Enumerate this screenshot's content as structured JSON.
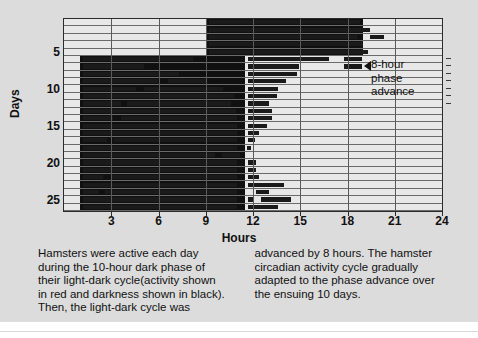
{
  "figure": {
    "background_color": "#dcdcdc",
    "plot_background_color": "#e8e8e8",
    "bar_color": "#101010"
  },
  "axes": {
    "x_title": "Hours",
    "y_title": "Days",
    "x_ticks": [
      "3",
      "6",
      "9",
      "12",
      "15",
      "18",
      "21",
      "24"
    ],
    "x_tick_values": [
      3,
      6,
      9,
      12,
      15,
      18,
      21,
      24
    ],
    "x_range": [
      0,
      24
    ],
    "y_ticks": [
      "5",
      "10",
      "15",
      "20",
      "25"
    ],
    "y_tick_values": [
      5,
      10,
      15,
      20,
      25
    ],
    "y_range": [
      0.5,
      26.5
    ]
  },
  "annotation": {
    "arrow": "left-triangle-arrow",
    "lines": [
      "8-hour",
      "phase",
      "advance"
    ],
    "day": 6
  },
  "caption": {
    "left_lines": [
      "Hamsters were active each day",
      "during the 10-hour dark phase of",
      "their light-dark cycle(activity shown",
      "in red and darkness shown in black).",
      "Then, the light-dark cycle was"
    ],
    "right_lines": [
      "advanced by 8 hours. The hamster",
      "circadian activity cycle gradually",
      "adapted to the phase advance over",
      "the ensuing 10 days."
    ]
  },
  "chart_data": {
    "type": "bar",
    "title": "",
    "subtitle": "",
    "xlabel": "Hours",
    "ylabel": "Days",
    "xlim": [
      0,
      24
    ],
    "ylim": [
      26.5,
      0.5
    ],
    "grid": true,
    "legend": "none",
    "dark_phase_before_shift": {
      "days": [
        1,
        5
      ],
      "start_hour": 9.0,
      "end_hour": 19.0
    },
    "dark_phase_after_shift": {
      "days": [
        6,
        26
      ],
      "start_hour": 1.0,
      "end_hour": 11.5
    },
    "rows": [
      {
        "day": 1,
        "dark": [
          9.0,
          19.0
        ],
        "activity": [
          [
            9.2,
            18.8
          ]
        ]
      },
      {
        "day": 2,
        "dark": [
          9.0,
          19.0
        ],
        "activity": [
          [
            9.2,
            19.4
          ]
        ]
      },
      {
        "day": 3,
        "dark": [
          9.0,
          19.0
        ],
        "activity": [
          [
            9.2,
            18.6
          ],
          [
            19.4,
            20.3
          ]
        ]
      },
      {
        "day": 4,
        "dark": [
          9.0,
          19.0
        ],
        "activity": [
          [
            9.2,
            19.0
          ]
        ]
      },
      {
        "day": 5,
        "dark": [
          9.0,
          19.0
        ],
        "activity": [
          [
            9.2,
            19.3
          ]
        ]
      },
      {
        "day": 6,
        "dark": [
          1.0,
          11.5
        ],
        "activity": [
          [
            1.2,
            8.2
          ],
          [
            11.7,
            16.8
          ],
          [
            17.8,
            18.9
          ]
        ]
      },
      {
        "day": 7,
        "dark": [
          1.0,
          11.5
        ],
        "activity": [
          [
            1.2,
            5.1
          ],
          [
            11.7,
            14.9
          ],
          [
            17.8,
            18.9
          ]
        ]
      },
      {
        "day": 8,
        "dark": [
          1.0,
          11.5
        ],
        "activity": [
          [
            1.2,
            7.3
          ],
          [
            11.7,
            14.8
          ]
        ]
      },
      {
        "day": 9,
        "dark": [
          1.0,
          11.5
        ],
        "activity": [
          [
            1.2,
            6.0
          ],
          [
            6.6,
            9.0
          ],
          [
            11.7,
            14.1
          ]
        ]
      },
      {
        "day": 10,
        "dark": [
          1.0,
          11.5
        ],
        "activity": [
          [
            1.2,
            4.6
          ],
          [
            5.1,
            10.1
          ],
          [
            11.7,
            13.6
          ]
        ]
      },
      {
        "day": 11,
        "dark": [
          1.0,
          11.5
        ],
        "activity": [
          [
            1.2,
            10.8
          ],
          [
            11.7,
            13.5
          ]
        ]
      },
      {
        "day": 12,
        "dark": [
          1.0,
          11.5
        ],
        "activity": [
          [
            1.2,
            3.6
          ],
          [
            4.0,
            10.6
          ],
          [
            11.7,
            13.0
          ]
        ]
      },
      {
        "day": 13,
        "dark": [
          1.0,
          11.5
        ],
        "activity": [
          [
            1.2,
            10.9
          ],
          [
            11.7,
            13.2
          ]
        ]
      },
      {
        "day": 14,
        "dark": [
          1.0,
          11.5
        ],
        "activity": [
          [
            1.2,
            3.1
          ],
          [
            3.6,
            11.0
          ],
          [
            11.7,
            13.2
          ]
        ]
      },
      {
        "day": 15,
        "dark": [
          1.0,
          11.5
        ],
        "activity": [
          [
            1.2,
            11.0
          ],
          [
            11.7,
            12.9
          ]
        ]
      },
      {
        "day": 16,
        "dark": [
          1.0,
          11.5
        ],
        "activity": [
          [
            1.2,
            11.0
          ],
          [
            11.7,
            12.4
          ]
        ]
      },
      {
        "day": 17,
        "dark": [
          1.0,
          11.5
        ],
        "activity": [
          [
            1.2,
            2.7
          ],
          [
            3.2,
            11.0
          ],
          [
            11.7,
            12.1
          ]
        ]
      },
      {
        "day": 18,
        "dark": [
          1.0,
          11.5
        ],
        "activity": [
          [
            1.2,
            11.0
          ],
          [
            11.6,
            11.9
          ]
        ]
      },
      {
        "day": 19,
        "dark": [
          1.0,
          11.5
        ],
        "activity": [
          [
            1.2,
            9.6
          ],
          [
            10.0,
            11.2
          ]
        ]
      },
      {
        "day": 20,
        "dark": [
          1.0,
          11.5
        ],
        "activity": [
          [
            1.2,
            11.0
          ],
          [
            11.7,
            12.2
          ]
        ]
      },
      {
        "day": 21,
        "dark": [
          1.0,
          11.5
        ],
        "activity": [
          [
            1.2,
            11.0
          ],
          [
            11.7,
            12.2
          ]
        ]
      },
      {
        "day": 22,
        "dark": [
          1.0,
          11.5
        ],
        "activity": [
          [
            1.2,
            2.5
          ],
          [
            3.0,
            11.0
          ],
          [
            11.7,
            12.4
          ]
        ]
      },
      {
        "day": 23,
        "dark": [
          1.0,
          11.5
        ],
        "activity": [
          [
            1.2,
            11.0
          ],
          [
            11.7,
            14.0
          ]
        ]
      },
      {
        "day": 24,
        "dark": [
          1.0,
          11.5
        ],
        "activity": [
          [
            1.2,
            2.2
          ],
          [
            2.6,
            11.0
          ],
          [
            12.2,
            13.0
          ]
        ]
      },
      {
        "day": 25,
        "dark": [
          1.0,
          11.5
        ],
        "activity": [
          [
            1.2,
            11.0
          ],
          [
            11.7,
            12.0
          ],
          [
            12.5,
            14.4
          ]
        ]
      },
      {
        "day": 26,
        "dark": [
          1.0,
          11.5
        ],
        "activity": [
          [
            1.2,
            11.0
          ],
          [
            11.7,
            13.6
          ]
        ]
      }
    ]
  }
}
